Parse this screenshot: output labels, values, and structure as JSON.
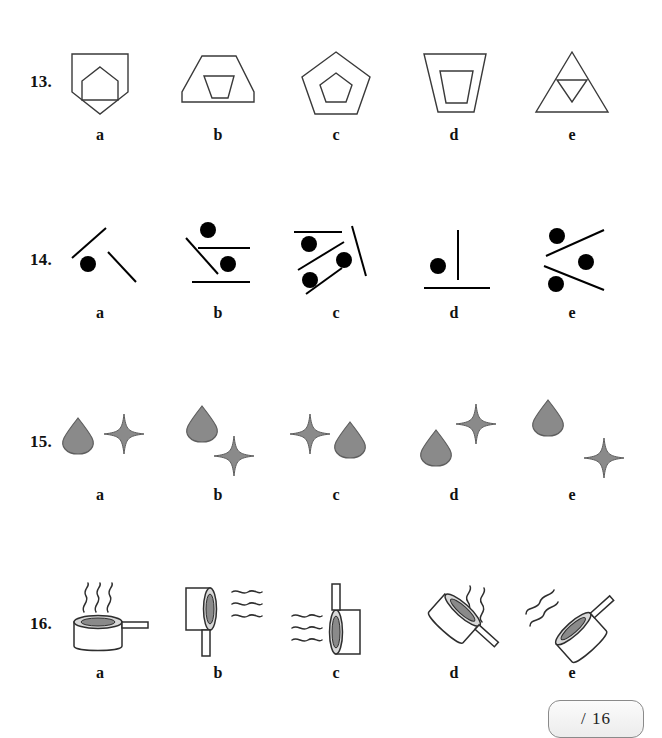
{
  "page": {
    "background_color": "#ffffff",
    "stroke_color": "#3a3a3a",
    "fill_grey": "#8a8a8a",
    "dot_color": "#000000"
  },
  "option_letters": [
    "a",
    "b",
    "c",
    "d",
    "e"
  ],
  "questions": [
    {
      "number": "13.",
      "theme": "outlined polygon containing a smaller polygon",
      "options": [
        {
          "letter": "a",
          "description": "home-plate pentagon containing upright house pentagon"
        },
        {
          "letter": "b",
          "description": "wide flat-topped pentagon containing inverted trapezoid"
        },
        {
          "letter": "c",
          "description": "regular pentagon containing small pentagon"
        },
        {
          "letter": "d",
          "description": "tall inverted trapezoid containing small inverted trapezoid"
        },
        {
          "letter": "e",
          "description": "triangle containing small inverted triangle"
        }
      ]
    },
    {
      "number": "14.",
      "theme": "black dots with straight line segments",
      "options": [
        {
          "letter": "a",
          "description": "one dot with two diagonal lines forming a wide V-apex"
        },
        {
          "letter": "b",
          "description": "two dots, two horizontal lines and one diagonal line"
        },
        {
          "letter": "c",
          "description": "three dots with horizontal line and three diagonal lines"
        },
        {
          "letter": "d",
          "description": "one dot with a vertical line and a horizontal base line"
        },
        {
          "letter": "e",
          "description": "three dots with two crossing diagonal lines"
        }
      ]
    },
    {
      "number": "15.",
      "theme": "grey teardrop and grey four-pointed star",
      "options": [
        {
          "letter": "a",
          "description": "teardrop left, star right, level"
        },
        {
          "letter": "b",
          "description": "teardrop upper-left, star lower-right"
        },
        {
          "letter": "c",
          "description": "star left, teardrop right"
        },
        {
          "letter": "d",
          "description": "teardrop lower-left, star upper-right"
        },
        {
          "letter": "e",
          "description": "teardrop upper-left, star lower-right, wider spread"
        }
      ]
    },
    {
      "number": "16.",
      "theme": "saucepan with steam at varying rotations",
      "options": [
        {
          "letter": "a",
          "description": "pan upright, handle right, steam above"
        },
        {
          "letter": "b",
          "description": "pan rotated 90 degrees, handle down, steam right"
        },
        {
          "letter": "c",
          "description": "pan rotated, handle up, steam left"
        },
        {
          "letter": "d",
          "description": "pan tilted, handle lower-right, steam upper-right"
        },
        {
          "letter": "e",
          "description": "pan tilted, handle upper-right, steam upper-left"
        }
      ]
    }
  ],
  "score": {
    "value": "",
    "total_label": "/ 16"
  }
}
